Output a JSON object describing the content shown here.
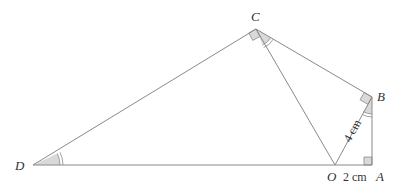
{
  "diagram": {
    "type": "geometry",
    "points": {
      "C": {
        "label": "C",
        "x": 256,
        "y": 29
      },
      "B": {
        "label": "B",
        "x": 372,
        "y": 97
      },
      "A": {
        "label": "A",
        "x": 372,
        "y": 165
      },
      "O": {
        "label": "O",
        "x": 335,
        "y": 165
      },
      "D": {
        "label": "D",
        "x": 33,
        "y": 165
      }
    },
    "segments": [
      "DC",
      "CB",
      "BA",
      "AO",
      "OD",
      "CO",
      "OB"
    ],
    "right_angles": [
      "C",
      "B",
      "A"
    ],
    "marked_equal_angles": [
      "ADC",
      "OCB",
      "OBA"
    ],
    "measurements": {
      "OB": "4 cm",
      "OA": "2 cm"
    }
  }
}
